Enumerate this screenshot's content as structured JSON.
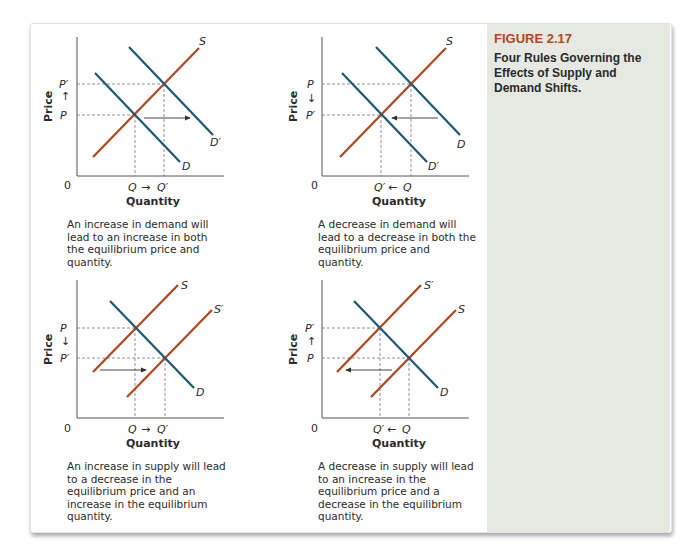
{
  "figure": {
    "label": "FIGURE 2.17",
    "title": "Four Rules Governing the Effects of Supply and Demand Shifts."
  },
  "colors": {
    "supply": "#b4441c",
    "demand": "#1c5873",
    "axis": "#555555",
    "figure_label": "#b5451b",
    "side_panel": "#e6e8e2"
  },
  "panels": [
    {
      "id": "increase-demand",
      "y_axis_label": "Price",
      "x_axis_label": "Quantity",
      "origin_label": "0",
      "price_upper": "P′",
      "price_lower": "P",
      "price_arrow": "↑",
      "qty_left": "Q",
      "qty_right": "Q′",
      "qty_arrow": "→",
      "curves": [
        "S",
        "D",
        "D′"
      ],
      "caption": "An increase in demand will lead to an increase in both the equilibrium price and quantity."
    },
    {
      "id": "decrease-demand",
      "y_axis_label": "Price",
      "x_axis_label": "Quantity",
      "origin_label": "0",
      "price_upper": "P",
      "price_lower": "P′",
      "price_arrow": "↓",
      "qty_left": "Q′",
      "qty_right": "Q",
      "qty_arrow": "←",
      "curves": [
        "S",
        "D",
        "D′"
      ],
      "caption": "A decrease in demand will lead to a decrease in both the equilibrium price and quantity."
    },
    {
      "id": "increase-supply",
      "y_axis_label": "Price",
      "x_axis_label": "Quantity",
      "origin_label": "0",
      "price_upper": "P",
      "price_lower": "P′",
      "price_arrow": "↓",
      "qty_left": "Q",
      "qty_right": "Q′",
      "qty_arrow": "→",
      "curves": [
        "S",
        "S′",
        "D"
      ],
      "caption": "An increase in supply will lead to a decrease in the equilibrium price and an increase in the equilibrium quantity."
    },
    {
      "id": "decrease-supply",
      "y_axis_label": "Price",
      "x_axis_label": "Quantity",
      "origin_label": "0",
      "price_upper": "P′",
      "price_lower": "P",
      "price_arrow": "↑",
      "qty_left": "Q′",
      "qty_right": "Q",
      "qty_arrow": "←",
      "curves": [
        "S′",
        "S",
        "D"
      ],
      "caption": "A decrease in supply will lead to an increase in the equilibrium price and a decrease in the equilibrium quantity."
    }
  ]
}
